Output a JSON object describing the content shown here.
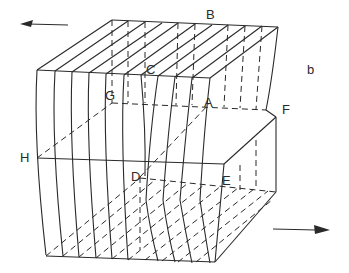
{
  "figure": {
    "panel_label": "b",
    "point_labels": [
      "A",
      "B",
      "C",
      "D",
      "E",
      "F",
      "G",
      "H"
    ],
    "arrows": [
      {
        "name": "top-shear-arrow",
        "direction": "left"
      },
      {
        "name": "bottom-shear-arrow",
        "direction": "right"
      }
    ]
  }
}
